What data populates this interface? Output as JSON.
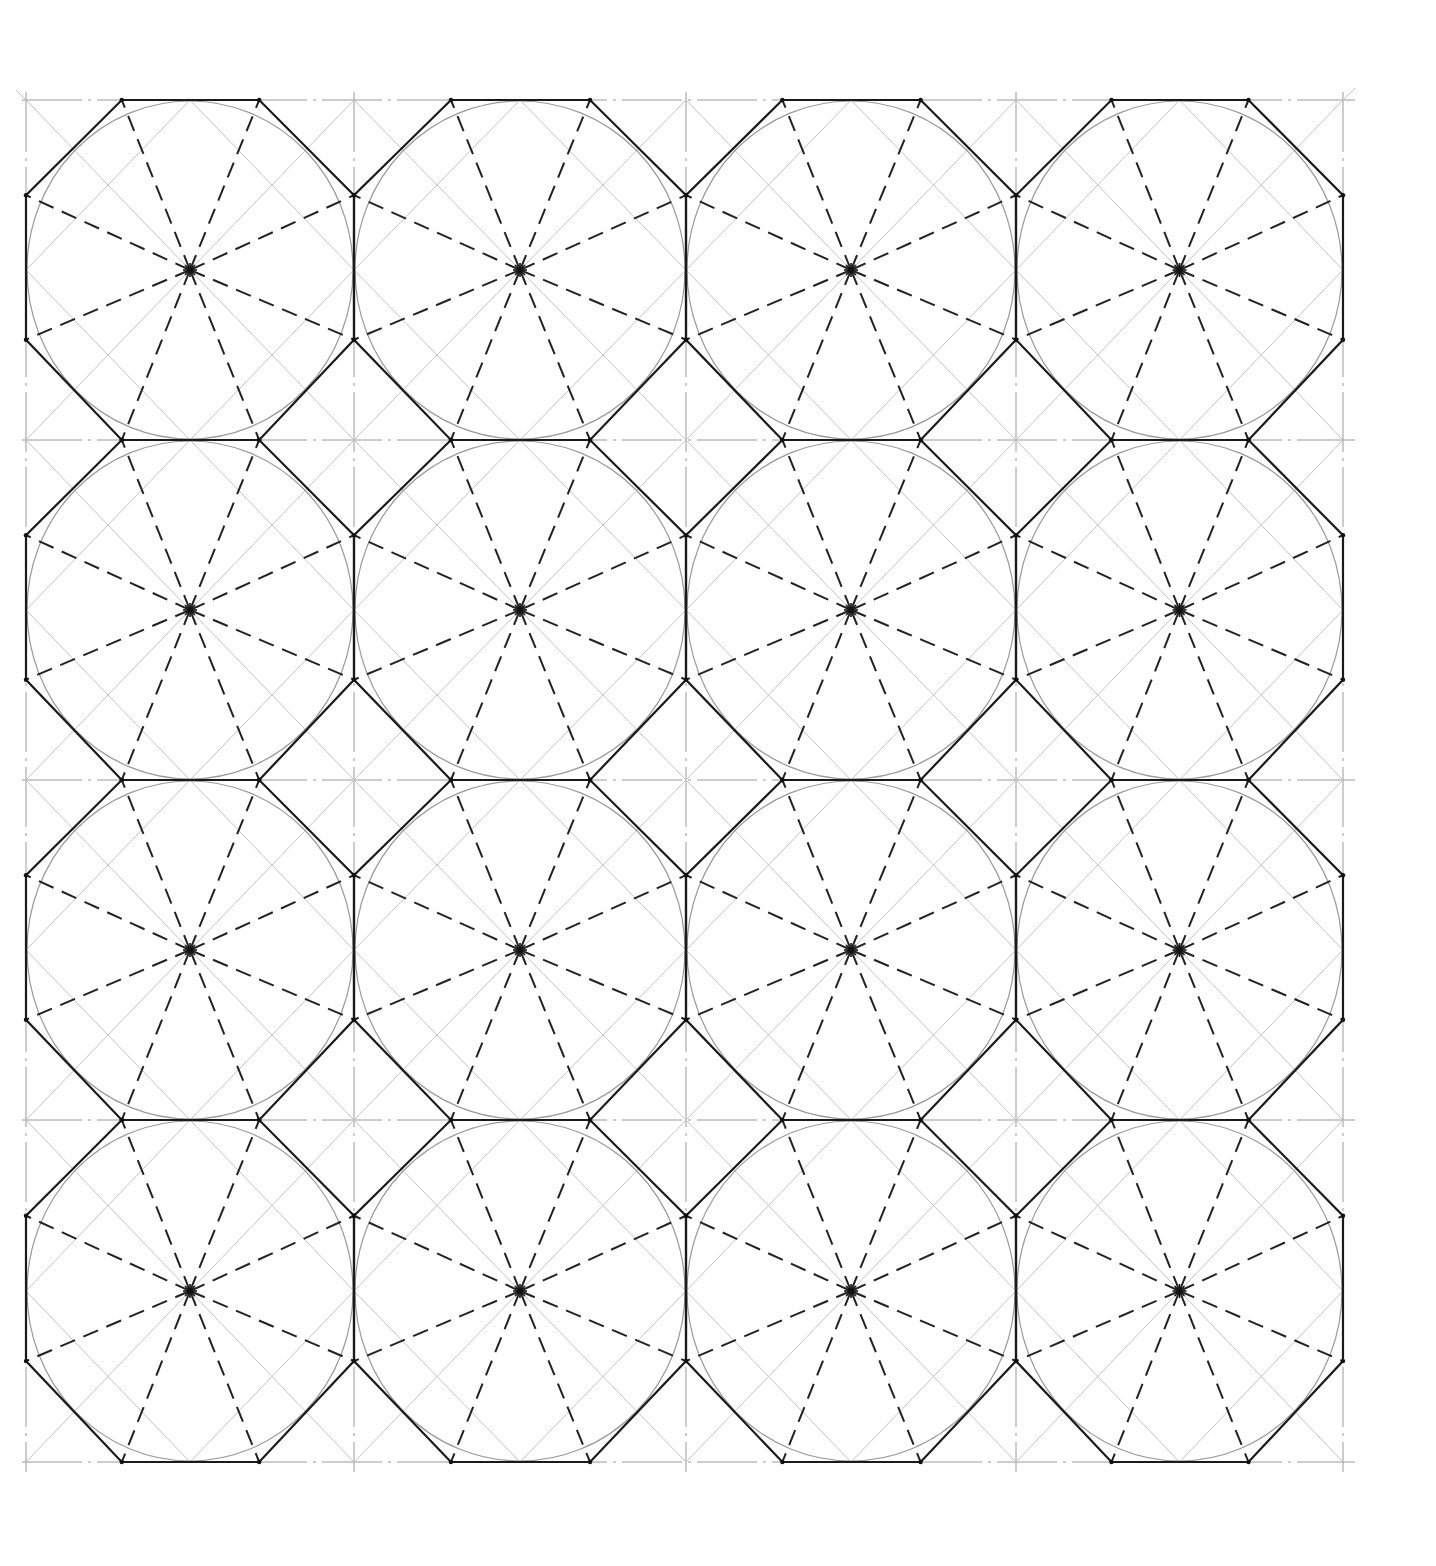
{
  "grid": {
    "rows": 4,
    "cols": 4,
    "origin": [
      26,
      100
    ],
    "cell_width": 329.25,
    "cell_height": 340.5,
    "vertical_lines_x": [
      26,
      354,
      686,
      1016,
      1343
    ],
    "horizontal_lines_y": [
      100,
      440,
      780,
      1120,
      1462
    ]
  },
  "octagon": {
    "top_edge_x_fraction": [
      0.292,
      0.711
    ],
    "side_edge_y_fraction": [
      0.28,
      0.705
    ]
  },
  "colors": {
    "background": "#ffffff",
    "octagon_stroke": "#1a1a1a",
    "spoke_stroke": "#222222",
    "circle_stroke": "#9a9a9a",
    "grid_stroke": "#9a9a9a",
    "construction_stroke": "#c4c4c4"
  }
}
